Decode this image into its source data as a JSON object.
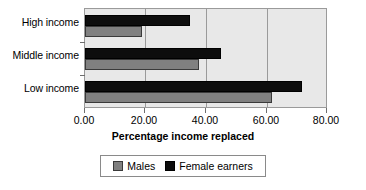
{
  "chart_data": {
    "type": "bar",
    "orientation": "horizontal",
    "title": "",
    "xlabel": "Percentage income replaced",
    "ylabel": "",
    "categories": [
      "High income",
      "Middle income",
      "Low income"
    ],
    "series": [
      {
        "name": "Males",
        "color": "#808080",
        "values": [
          19,
          38,
          62
        ]
      },
      {
        "name": "Female earners",
        "color": "#000000",
        "values": [
          35,
          45,
          72
        ]
      }
    ],
    "xlim": [
      0,
      80
    ],
    "xticks": [
      0,
      20,
      40,
      60,
      80
    ],
    "xticklabels": [
      "0.00",
      "20.00",
      "40.00",
      "60.00",
      "80.00"
    ],
    "grid": true,
    "grid_axis": "x",
    "legend": {
      "position": "bottom",
      "entries": [
        "Males",
        "Female earners"
      ]
    },
    "plot_background": "#e8e8e8",
    "frame_color": "#9a9a9a"
  },
  "axis": {
    "title": "Percentage income replaced",
    "tick_labels": [
      "0.00",
      "20.00",
      "40.00",
      "60.00",
      "80.00"
    ]
  },
  "categories": {
    "c0": "High income",
    "c1": "Middle income",
    "c2": "Low income"
  },
  "legend": {
    "males": "Males",
    "females": "Female earners"
  }
}
